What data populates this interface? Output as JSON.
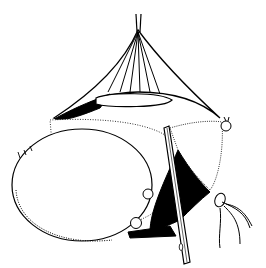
{
  "figure": {
    "kind": "surgical-line-illustration",
    "style": "black ink on white",
    "colors": {
      "ink": "#000000",
      "paper": "#ffffff"
    },
    "elements": [
      "retracted-tissue-tent",
      "traction-sutures",
      "oval-cyst-mass",
      "vertical-retractor-instrument",
      "suture-ligatures",
      "vessel-bundle"
    ]
  }
}
